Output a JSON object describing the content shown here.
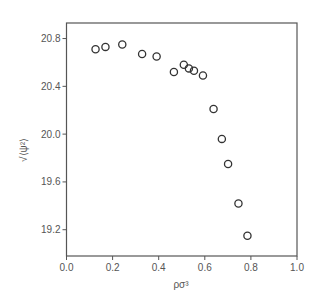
{
  "chart_data": {
    "type": "scatter",
    "title": "",
    "xlabel": "ρσ³",
    "ylabel": "√⟨ψ²⟩",
    "xlim": [
      0.0,
      1.0
    ],
    "ylim": [
      18.98,
      20.93
    ],
    "xticks": [
      0.0,
      0.2,
      0.4,
      0.6,
      0.8,
      1.0
    ],
    "xtick_labels": [
      "0.0",
      "0.2",
      "0.4",
      "0.6",
      "0.8",
      "1.0"
    ],
    "yticks": [
      19.2,
      19.6,
      20.0,
      20.4,
      20.8
    ],
    "ytick_labels": [
      "19.2",
      "19.6",
      "20.0",
      "20.4",
      "20.8"
    ],
    "grid": false,
    "legend": null,
    "marker": "open-circle",
    "series": [
      {
        "name": "data",
        "x": [
          0.126,
          0.169,
          0.242,
          0.328,
          0.391,
          0.466,
          0.509,
          0.531,
          0.553,
          0.592,
          0.638,
          0.674,
          0.701,
          0.746,
          0.785
        ],
        "y": [
          20.71,
          20.73,
          20.75,
          20.67,
          20.65,
          20.52,
          20.58,
          20.55,
          20.53,
          20.49,
          20.21,
          19.96,
          19.75,
          19.42,
          19.15
        ]
      }
    ]
  },
  "colors": {
    "axis": "#555555",
    "marker": "#333333",
    "text": "#555555"
  }
}
